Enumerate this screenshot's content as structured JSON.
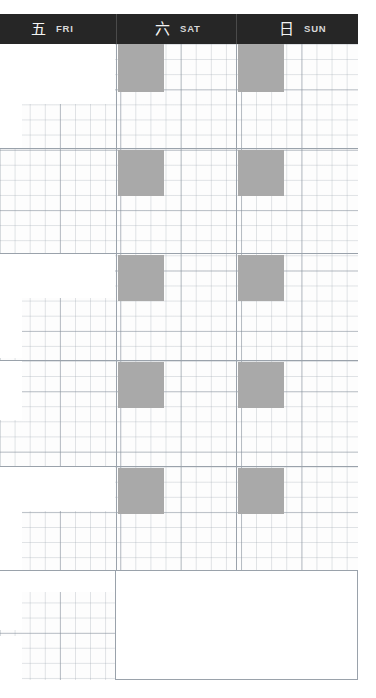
{
  "page": {
    "width": 376,
    "height": 698,
    "background": "#ffffff",
    "paper_background": "#fdfdfd"
  },
  "colors": {
    "header_background": "#262626",
    "header_text": "#f4f4f4",
    "header_label_text": "#d8d8d8",
    "header_divider": "#4a4a4a",
    "grid_line_fine": "#96a0aa",
    "grid_line_major": "#9aa2ab",
    "sticker_fill": "#a9a9a9",
    "mask_fill": "#ffffff"
  },
  "header": {
    "days": [
      {
        "cn": "五",
        "en": "FRI",
        "name": "friday"
      },
      {
        "cn": "六",
        "en": "SAT",
        "name": "saturday"
      },
      {
        "cn": "日",
        "en": "SUN",
        "name": "sunday"
      }
    ]
  },
  "layout": {
    "grid": {
      "left": 0,
      "top": 44,
      "width": 359,
      "height": 636,
      "fine_cell": 15.1,
      "major_cell": 60.4
    },
    "columns": [
      {
        "name": "col-fri",
        "left": 0,
        "right": 116
      },
      {
        "name": "col-sat",
        "left": 116,
        "right": 236
      },
      {
        "name": "col-sun",
        "left": 236,
        "right": 358
      }
    ],
    "vertical_rules": [
      {
        "x": 116,
        "top": 44,
        "height": 526
      },
      {
        "x": 236,
        "top": 44,
        "height": 526
      }
    ],
    "horizontal_rules": [
      {
        "x": 0,
        "y": 148,
        "width": 358
      },
      {
        "x": 0,
        "y": 253,
        "width": 358
      },
      {
        "x": 0,
        "y": 360,
        "width": 358
      },
      {
        "x": 0,
        "y": 466,
        "width": 358
      },
      {
        "x": 0,
        "y": 570,
        "width": 358
      }
    ],
    "stickers": [
      {
        "name": "sticker-sat-1",
        "x": 118,
        "y": 44,
        "w": 46,
        "h": 48
      },
      {
        "name": "sticker-sun-1",
        "x": 238,
        "y": 44,
        "w": 46,
        "h": 48
      },
      {
        "name": "sticker-sat-2",
        "x": 118,
        "y": 150,
        "w": 46,
        "h": 46
      },
      {
        "name": "sticker-sun-2",
        "x": 238,
        "y": 150,
        "w": 46,
        "h": 46
      },
      {
        "name": "sticker-sat-3",
        "x": 118,
        "y": 255,
        "w": 46,
        "h": 46
      },
      {
        "name": "sticker-sun-3",
        "x": 238,
        "y": 255,
        "w": 46,
        "h": 46
      },
      {
        "name": "sticker-sat-4",
        "x": 118,
        "y": 362,
        "w": 46,
        "h": 46
      },
      {
        "name": "sticker-sun-4",
        "x": 238,
        "y": 362,
        "w": 46,
        "h": 46
      },
      {
        "name": "sticker-sat-5",
        "x": 118,
        "y": 468,
        "w": 46,
        "h": 46
      },
      {
        "name": "sticker-sun-5",
        "x": 238,
        "y": 468,
        "w": 46,
        "h": 46
      }
    ],
    "masks": [
      {
        "name": "mask-row-1",
        "x": 0,
        "y": 44,
        "w": 22,
        "h": 104
      },
      {
        "name": "mask-row-1b",
        "x": 0,
        "y": 44,
        "w": 115,
        "h": 60
      },
      {
        "name": "mask-row-2",
        "x": 0,
        "y": 253,
        "w": 115,
        "h": 45
      },
      {
        "name": "mask-row-2b",
        "x": 0,
        "y": 253,
        "w": 22,
        "h": 105
      },
      {
        "name": "mask-row-3",
        "x": 0,
        "y": 360,
        "w": 22,
        "h": 60
      },
      {
        "name": "mask-row-4",
        "x": 0,
        "y": 466,
        "w": 115,
        "h": 45
      },
      {
        "name": "mask-row-4b",
        "x": 0,
        "y": 466,
        "w": 22,
        "h": 104
      },
      {
        "name": "mask-row-5",
        "x": 0,
        "y": 570,
        "w": 22,
        "h": 60
      },
      {
        "name": "mask-row-5b",
        "x": 0,
        "y": 570,
        "w": 115,
        "h": 22
      },
      {
        "name": "mask-row-6",
        "x": 0,
        "y": 636,
        "w": 22,
        "h": 44
      }
    ],
    "note_area": {
      "name": "note-area",
      "x": 115,
      "y": 570,
      "w": 243,
      "h": 110
    }
  }
}
